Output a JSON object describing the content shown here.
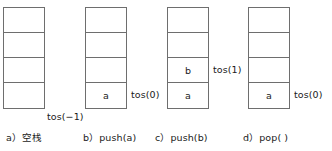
{
  "figure": {
    "background_color": "#ffffff",
    "border_color": "#6e6e6e",
    "text_color": "#1a1a1a",
    "cell_count": 4
  },
  "panels": [
    {
      "id": "panel-a",
      "caption": "a）空栈",
      "tos_label": "tos(−1)",
      "tos_position": "below-stack",
      "cells_bottom_to_top": [
        "",
        "",
        "",
        ""
      ]
    },
    {
      "id": "panel-b",
      "caption": "b）push(a)",
      "tos_label": "tos(0)",
      "tos_position": "row-0",
      "cells_bottom_to_top": [
        "a",
        "",
        "",
        ""
      ]
    },
    {
      "id": "panel-c",
      "caption": "c）push(b)",
      "tos_label": "tos(1)",
      "tos_position": "row-1",
      "cells_bottom_to_top": [
        "a",
        "b",
        "",
        ""
      ]
    },
    {
      "id": "panel-d",
      "caption": "d）pop( )",
      "tos_label": "tos(0)",
      "tos_position": "row-0",
      "cells_bottom_to_top": [
        "a",
        "",
        "",
        ""
      ]
    }
  ]
}
